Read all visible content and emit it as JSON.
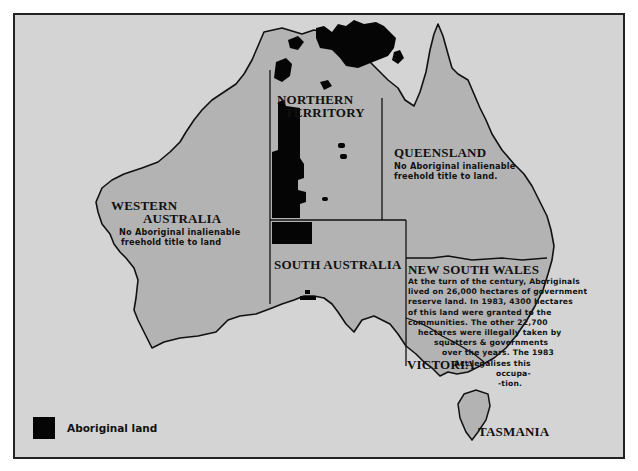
{
  "map": {
    "title": "Aboriginal land in Australia",
    "colors": {
      "ocean": "#d4d4d4",
      "land": "#b3b3b3",
      "aboriginal_land": "#050505",
      "border": "#111111"
    },
    "states": [
      {
        "id": "nt",
        "name_line1": "NORTHERN",
        "name_line2": "TERRITORY"
      },
      {
        "id": "qld",
        "name": "QUEENSLAND",
        "note_line1": "No Aboriginal inalienable",
        "note_line2": "freehold title to land."
      },
      {
        "id": "wa",
        "name_line1": "WESTERN",
        "name_line2": "AUSTRALIA",
        "note_line1": "No Aboriginal  inalienable",
        "note_line2": "freehold title to land"
      },
      {
        "id": "sa",
        "name": "SOUTH AUSTRALIA"
      },
      {
        "id": "nsw",
        "name": "NEW SOUTH WALES",
        "note_lines": [
          "At the turn of the century, Aboriginals",
          "lived on 26,000 hectares of government",
          "reserve land. In 1983, 4300 hectares",
          "of this land were granted to the",
          "communities. The other 22,700",
          "hectares were illegally taken by",
          "squatters & governments",
          "over the years. The 1983",
          "Act legalises this",
          "occupa-",
          "-tion."
        ]
      },
      {
        "id": "vic",
        "name": "VICTORIA"
      },
      {
        "id": "tas",
        "name": "TASMANIA"
      }
    ]
  },
  "legend": {
    "items": [
      {
        "label": "Aboriginal land",
        "color": "#050505"
      }
    ]
  }
}
